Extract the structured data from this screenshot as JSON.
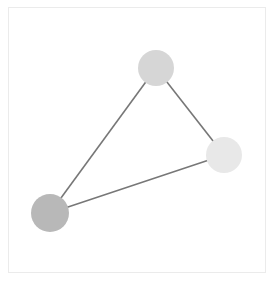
{
  "diagram": {
    "type": "graph",
    "frame": {
      "x": 8,
      "y": 7,
      "width": 258,
      "height": 266,
      "border_color": "#ebebeb"
    },
    "edge_color": "#777777",
    "edge_width": 1.6,
    "nodes": [
      {
        "id": "top",
        "cx": 156,
        "cy": 68,
        "r": 18,
        "color": "#d6d6d6"
      },
      {
        "id": "right",
        "cx": 224,
        "cy": 155,
        "r": 18,
        "color": "#e8e8e8"
      },
      {
        "id": "left",
        "cx": 50,
        "cy": 213,
        "r": 19,
        "color": "#b8b8b8"
      }
    ],
    "edges": [
      {
        "from": "top",
        "to": "left"
      },
      {
        "from": "top",
        "to": "right"
      },
      {
        "from": "right",
        "to": "left"
      }
    ]
  }
}
